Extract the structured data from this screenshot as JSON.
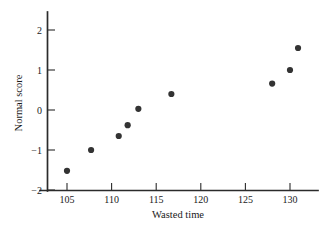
{
  "chart_data": {
    "type": "scatter",
    "title": "",
    "xlabel": "Wasted time",
    "ylabel": "Normal score",
    "xlim": [
      103.5,
      133
    ],
    "ylim": [
      -2.15,
      2.4
    ],
    "grid": false,
    "legend": "none",
    "xticks": [
      105,
      110,
      115,
      120,
      125,
      130
    ],
    "xtick_labels": [
      "105",
      "110",
      "115",
      "120",
      "125",
      "130"
    ],
    "yticks": [
      -2,
      -1,
      0,
      1,
      2
    ],
    "ytick_labels": [
      "−2",
      "−1",
      "0",
      "1",
      "2"
    ],
    "marker_color": "#333333",
    "marker_size": 3.1,
    "points": [
      {
        "x": 105.0,
        "y": -1.52
      },
      {
        "x": 107.7,
        "y": -1.0
      },
      {
        "x": 110.8,
        "y": -0.65
      },
      {
        "x": 111.8,
        "y": -0.38
      },
      {
        "x": 113.0,
        "y": 0.03
      },
      {
        "x": 116.7,
        "y": 0.4
      },
      {
        "x": 128.0,
        "y": 0.66
      },
      {
        "x": 130.0,
        "y": 1.0
      },
      {
        "x": 130.9,
        "y": 1.55
      }
    ]
  }
}
